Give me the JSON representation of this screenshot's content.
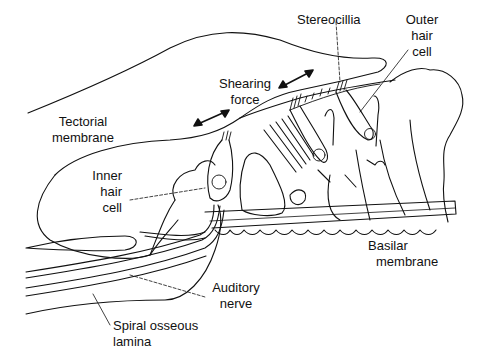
{
  "diagram": {
    "colors": {
      "line": "#111111",
      "background": "#ffffff"
    },
    "labels": {
      "stereocilia": "Stereocillia",
      "outer_hair_cell": [
        "Outer",
        "hair",
        "cell"
      ],
      "shearing_force": [
        "Shearing",
        "force"
      ],
      "tectorial_membrane": [
        "Tectorial",
        "membrane"
      ],
      "inner_hair_cell": [
        "Inner",
        "hair",
        "cell"
      ],
      "basilar_membrane": [
        "Basilar",
        "membrane"
      ],
      "auditory_nerve": [
        "Auditory",
        "nerve"
      ],
      "spiral_osseous_lamina": [
        "Spiral osseous",
        "lamina"
      ]
    }
  }
}
